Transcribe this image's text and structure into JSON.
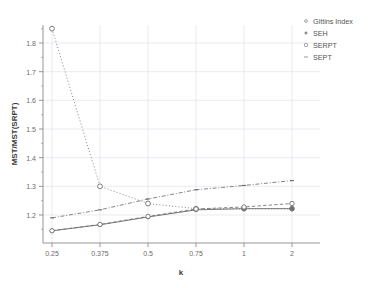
{
  "chart_data": {
    "type": "line",
    "title": "",
    "xlabel": "k",
    "ylabel": "MST/MST(SRPT)",
    "categories": [
      "0.25",
      "0.375",
      "0.5",
      "0.75",
      "1",
      "2"
    ],
    "x_tick_labels": [
      "0.25",
      "0.375",
      "0.5",
      "0.75",
      "1",
      "2"
    ],
    "y_tick_labels": [
      "1.2",
      "1.3",
      "1.4",
      "1.5",
      "1.6",
      "1.7",
      "1.8"
    ],
    "ylim": [
      1.13,
      1.86
    ],
    "xlim": [
      0,
      5
    ],
    "grid": true,
    "legend_position": "top-right",
    "series": [
      {
        "name": "Gittins Index",
        "values": [
          1.85,
          1.3,
          1.24,
          1.222,
          1.222,
          1.222
        ],
        "line_style": "dotted",
        "marker": "circle",
        "color": "#6f6f6f"
      },
      {
        "name": "SEH",
        "values": [
          1.145,
          1.166,
          1.193,
          1.218,
          1.222,
          1.222
        ],
        "line_style": "solid",
        "marker": "circle",
        "color": "#6f6f6f"
      },
      {
        "name": "SERPT",
        "values": [
          1.145,
          1.167,
          1.195,
          1.221,
          1.228,
          1.24
        ],
        "line_style": "dashed",
        "marker": "circle",
        "color": "#6f6f6f"
      },
      {
        "name": "SEPT",
        "values": [
          1.19,
          1.218,
          1.256,
          1.288,
          1.303,
          1.32
        ],
        "line_style": "dashdot",
        "marker": "tick",
        "color": "#6f6f6f"
      }
    ]
  },
  "legend": {
    "entries": [
      {
        "label": "Gittins Index"
      },
      {
        "label": "SEH"
      },
      {
        "label": "SERPT"
      },
      {
        "label": "SEPT"
      }
    ]
  },
  "colors": {
    "line": "#6f6f6f",
    "grid": "#d8dce4",
    "axis": "#8a8a8a",
    "text": "#5a5a5a"
  }
}
